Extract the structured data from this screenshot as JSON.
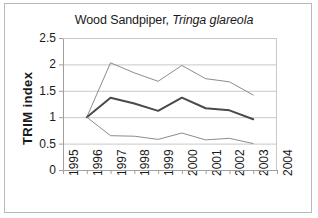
{
  "figure": {
    "border_color": "#b9b9b9",
    "background": "#ffffff"
  },
  "title": {
    "common_name": "Wood Sandpiper, ",
    "scientific_name": "Tringa glareola",
    "full": "Wood Sandpiper, Tringa glareola"
  },
  "axes": {
    "y_title": "TRIM  index",
    "y_ticks": [
      "0",
      "0.5",
      "1",
      "1.5",
      "2",
      "2.5"
    ],
    "x_ticks": [
      "1995",
      "1996",
      "1997",
      "1998",
      "1999",
      "2000",
      "2001",
      "2002",
      "2003",
      "2004"
    ]
  },
  "chart_data": {
    "type": "line",
    "title": "Wood Sandpiper, Tringa glareola",
    "xlabel": "",
    "ylabel": "TRIM  index",
    "x": [
      1995,
      1996,
      1997,
      1998,
      1999,
      2000,
      2001,
      2002,
      2003,
      2004
    ],
    "xlim": [
      1995,
      2004
    ],
    "ylim": [
      0,
      2.5
    ],
    "yticks": [
      0,
      0.5,
      1,
      1.5,
      2,
      2.5
    ],
    "grid": "horizontal",
    "legend": "none",
    "series": [
      {
        "name": "upper confidence limit",
        "color": "#8c8c8c",
        "width": 1,
        "x": [
          1996,
          1997,
          1998,
          1999,
          2000,
          2001,
          2002,
          2003
        ],
        "values": [
          1.0,
          2.03,
          1.84,
          1.68,
          1.98,
          1.73,
          1.67,
          1.42
        ]
      },
      {
        "name": "TRIM index",
        "color": "#4a4a4a",
        "width": 2,
        "x": [
          1996,
          1997,
          1998,
          1999,
          2000,
          2001,
          2002,
          2003
        ],
        "values": [
          1.0,
          1.37,
          1.26,
          1.12,
          1.37,
          1.17,
          1.13,
          0.96
        ]
      },
      {
        "name": "lower confidence limit",
        "color": "#8c8c8c",
        "width": 1,
        "x": [
          1996,
          1997,
          1998,
          1999,
          2000,
          2001,
          2002,
          2003
        ],
        "values": [
          1.0,
          0.65,
          0.64,
          0.58,
          0.7,
          0.57,
          0.6,
          0.5
        ]
      }
    ]
  },
  "geometry": {
    "plot_left": 63,
    "plot_right": 277,
    "plot_top": 38,
    "plot_bottom": 170
  }
}
